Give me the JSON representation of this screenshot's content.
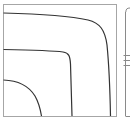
{
  "chart_data": {
    "type": "contour",
    "title": "",
    "xlabel": "",
    "ylabel": "",
    "grid": false,
    "legend": null,
    "frame": {
      "left": 3,
      "top": 4,
      "right": 116,
      "bottom": 116,
      "stroke": "#a6a6a6"
    },
    "contours": [
      {
        "name": "outer-contour",
        "level_index": 3,
        "stroke": "#333333",
        "path": "M3.5,13 C40,14 70,16 88,20 C100,23 105,30 107,45 C109,65 110,90 110.5,116"
      },
      {
        "name": "middle-contour",
        "level_index": 2,
        "stroke": "#333333",
        "path": "M3.5,49.5 C30,50 52,50.5 63,52 C69,53 70,56 70.5,64 C71,80 71.5,100 72,116"
      },
      {
        "name": "inner-contour",
        "level_index": 1,
        "stroke": "#333333",
        "path": "M3.5,80 C20,80.5 30,88 35,96 C39,103 40.5,110 41.5,116"
      }
    ],
    "adjacent_panel": {
      "clipped": true,
      "axis_x": 125.5,
      "top": 8,
      "bottom": 116,
      "stroke": "#8a8a8a",
      "top_curve": "M130,8 C127,8 126,9 125.8,12",
      "ticks_y": [
        55,
        60,
        65
      ],
      "bottom_tick_y": 116
    }
  }
}
